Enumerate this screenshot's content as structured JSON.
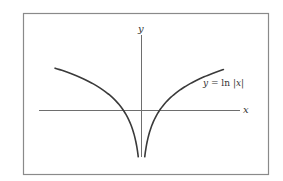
{
  "chart_data": {
    "type": "line",
    "title": "",
    "xlabel": "x",
    "ylabel": "y",
    "annotations": [
      {
        "text": "y = ln |x|",
        "near": "right branch, upper right"
      }
    ],
    "function": "y = ln|x|",
    "grid": false,
    "legend": null,
    "frame": true,
    "xlim": [
      -6.6,
      5.5
    ],
    "ylim": [
      -1.75,
      2.8
    ],
    "series": [
      {
        "name": "left branch (x < 0)",
        "x": [
          -4.8,
          -4.0,
          -3.0,
          -2.0,
          -1.0,
          -0.5,
          -0.3,
          -0.18
        ],
        "values": [
          1.57,
          1.39,
          1.1,
          0.69,
          0.0,
          -0.69,
          -1.2,
          -1.71
        ]
      },
      {
        "name": "right branch (x > 0)",
        "x": [
          0.18,
          0.3,
          0.5,
          1.0,
          2.0,
          3.0,
          4.0,
          4.55
        ],
        "values": [
          -1.71,
          -1.2,
          -0.69,
          0.0,
          0.69,
          1.1,
          1.39,
          1.52
        ]
      }
    ]
  },
  "labels": {
    "x_axis": "x",
    "y_axis": "y",
    "curve_prefix": "y = ln |",
    "curve_var": "x",
    "curve_suffix": "|"
  },
  "colors": {
    "frame": "#8a8a8a",
    "axes": "#6e6e6e",
    "curve": "#3a3a3a",
    "text": "#333333"
  }
}
